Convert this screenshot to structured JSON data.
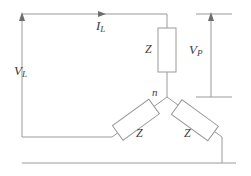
{
  "figure": {
    "name": "three-phase-wye-connection-diagram",
    "stroke_color": "#9a9a9a",
    "label_color": "#3c3c3c",
    "background": "#ffffff",
    "width": 251,
    "height": 176
  },
  "labels": {
    "line_current": {
      "symbol": "I",
      "subscript": "L"
    },
    "line_voltage": {
      "symbol": "V",
      "subscript": "L"
    },
    "phase_voltage": {
      "symbol": "V",
      "subscript": "P"
    },
    "neutral_node": "n",
    "impedance_top": "Z",
    "impedance_left": "Z",
    "impedance_right": "Z"
  }
}
